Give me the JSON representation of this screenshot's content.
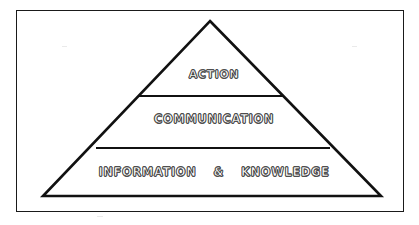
{
  "diagram": {
    "type": "pyramid",
    "title": "",
    "background_color": "#ffffff",
    "stroke_color": "#111111",
    "frame": {
      "name": "outer-border",
      "color": "#1a1a1a"
    },
    "tiers": [
      {
        "level": 1,
        "position": "top",
        "label": "ACTION"
      },
      {
        "level": 2,
        "position": "middle",
        "label": "COMMUNICATION"
      },
      {
        "level": 3,
        "position": "bottom",
        "label_parts": {
          "left": "INFORMATION",
          "separator": "&",
          "right": "KNOWLEDGE"
        },
        "label": "INFORMATION & KNOWLEDGE"
      }
    ]
  }
}
